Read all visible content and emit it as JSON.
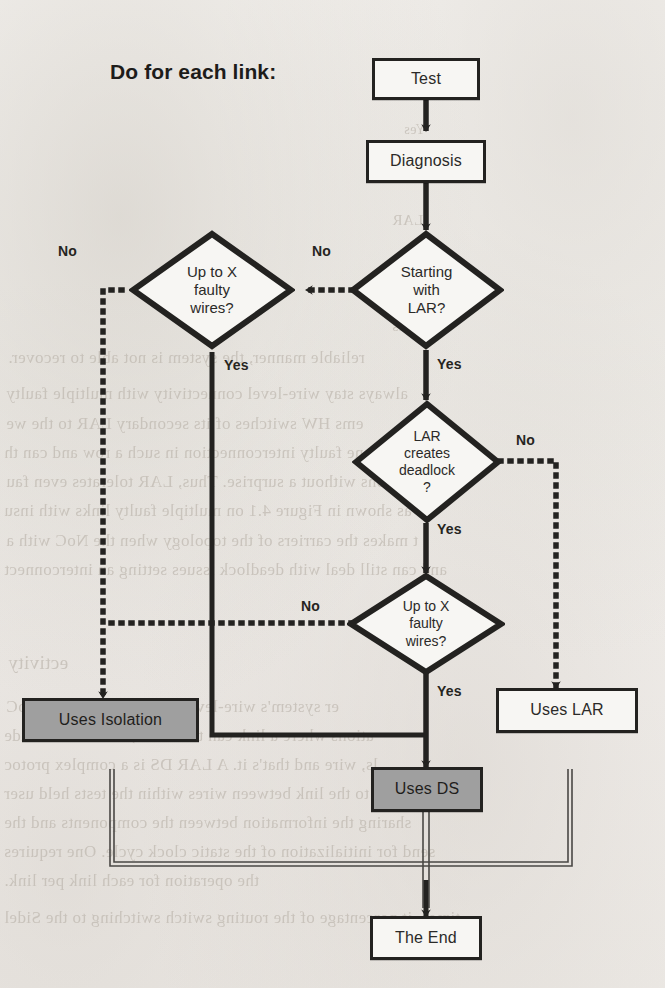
{
  "page": {
    "background_color": "#f3f1ee",
    "ink_color": "#232220",
    "shaded_fill": "#9f9f9f",
    "width": 665,
    "height": 988
  },
  "heading": {
    "text": "Do for each link:"
  },
  "nodes": {
    "test": {
      "label": "Test",
      "shape": "process",
      "fill": "white"
    },
    "diagnosis": {
      "label": "Diagnosis",
      "shape": "process",
      "fill": "white"
    },
    "starting_with_lar": {
      "label": "Starting\nwith\nLAR?",
      "shape": "decision",
      "fill": "white"
    },
    "up_to_x_faulty_wires_left": {
      "label": "Up to X\nfaulty\nwires?",
      "shape": "decision",
      "fill": "white"
    },
    "lar_creates_deadlock": {
      "label": "LAR\ncreates\ndeadlock\n?",
      "shape": "decision",
      "fill": "white"
    },
    "up_to_x_faulty_wires_mid": {
      "label": "Up to X\nfaulty\nwires?",
      "shape": "decision",
      "fill": "white"
    },
    "uses_isolation": {
      "label": "Uses Isolation",
      "shape": "process",
      "fill": "shaded"
    },
    "uses_ds": {
      "label": "Uses DS",
      "shape": "process",
      "fill": "shaded"
    },
    "uses_lar": {
      "label": "Uses LAR",
      "shape": "process",
      "fill": "white"
    },
    "the_end": {
      "label": "The End",
      "shape": "terminator",
      "fill": "white"
    }
  },
  "edge_labels": {
    "lar_no": "No",
    "left_no": "No",
    "lar_yes": "Yes",
    "left_yes": "Yes",
    "deadlock_no": "No",
    "deadlock_yes": "Yes",
    "mid_no": "No",
    "mid_yes": "Yes"
  },
  "edges": [
    {
      "from": "test",
      "to": "diagnosis",
      "label": "",
      "style": "solid"
    },
    {
      "from": "diagnosis",
      "to": "starting_with_lar",
      "label": "",
      "style": "solid"
    },
    {
      "from": "starting_with_lar",
      "to": "up_to_x_faulty_wires_left",
      "label": "No",
      "style": "dotted"
    },
    {
      "from": "starting_with_lar",
      "to": "lar_creates_deadlock",
      "label": "Yes",
      "style": "solid"
    },
    {
      "from": "up_to_x_faulty_wires_left",
      "to": "uses_isolation",
      "label": "No",
      "style": "dotted"
    },
    {
      "from": "up_to_x_faulty_wires_left",
      "to": "uses_ds",
      "label": "Yes",
      "style": "solid"
    },
    {
      "from": "lar_creates_deadlock",
      "to": "uses_lar",
      "label": "No",
      "style": "dotted"
    },
    {
      "from": "lar_creates_deadlock",
      "to": "up_to_x_faulty_wires_mid",
      "label": "Yes",
      "style": "solid"
    },
    {
      "from": "up_to_x_faulty_wires_mid",
      "to": "uses_isolation",
      "label": "No",
      "style": "dotted"
    },
    {
      "from": "up_to_x_faulty_wires_mid",
      "to": "uses_ds",
      "label": "Yes",
      "style": "solid"
    },
    {
      "from": "uses_isolation",
      "to": "the_end",
      "label": "",
      "style": "thin"
    },
    {
      "from": "uses_ds",
      "to": "the_end",
      "label": "",
      "style": "thin"
    },
    {
      "from": "uses_lar",
      "to": "the_end",
      "label": "",
      "style": "thin"
    }
  ],
  "bleed_text": [
    {
      "text": "reliable manner, the system is not able to recover.",
      "x": 8,
      "y": 348,
      "size": 17
    },
    {
      "text": "always stay wire-level connectivity with multiple faulty",
      "x": 6,
      "y": 384,
      "size": 17
    },
    {
      "text": "ems HW switches of its secondary LAR to the we",
      "x": 6,
      "y": 414,
      "size": 17
    },
    {
      "text": "reports that one faulty interconnection in such a row and can th",
      "x": 4,
      "y": 443,
      "size": 17
    },
    {
      "text": "ons without a surprise. Thus, LAR tolerates even fau",
      "x": 6,
      "y": 472,
      "size": 17
    },
    {
      "text": "oC as shown in Figure 4.1 on multiple faulty links with insu",
      "x": 4,
      "y": 501,
      "size": 17
    },
    {
      "text": "t makes the carriers of the topology when the NoC with a",
      "x": 6,
      "y": 531,
      "size": 17
    },
    {
      "text": "and can still deal with deadlock issues setting an interconnect",
      "x": 4,
      "y": 560,
      "size": 17
    },
    {
      "text": "ectivity",
      "x": 8,
      "y": 652,
      "size": 19
    },
    {
      "text": "er system's wire-level connectivity in the NoC",
      "x": 6,
      "y": 697,
      "size": 17
    },
    {
      "text": "ations where a link can terminate, link can be made",
      "x": 4,
      "y": 726,
      "size": 17
    },
    {
      "text": "ls, wire and that's it. A LAR DS is a complex protoc",
      "x": 4,
      "y": 755,
      "size": 17
    },
    {
      "text": "re to the link between wires within the tests held user",
      "x": 4,
      "y": 784,
      "size": 17
    },
    {
      "text": "sharing the information between the components and the",
      "x": 4,
      "y": 813,
      "size": 17
    },
    {
      "text": "send for initialization of the static clock cycle. One requires",
      "x": 4,
      "y": 842,
      "size": 17
    },
    {
      "text": "the operation for each link per link.",
      "x": 4,
      "y": 871,
      "size": 17
    },
    {
      "text": "times, it percentage of the routing switch switching to the Sidel",
      "x": 4,
      "y": 908,
      "size": 17
    },
    {
      "text": "LAR",
      "x": 392,
      "y": 212,
      "size": 15
    },
    {
      "text": "wires",
      "x": 392,
      "y": 318,
      "size": 15
    },
    {
      "text": "Yes",
      "x": 404,
      "y": 122,
      "size": 14
    }
  ]
}
